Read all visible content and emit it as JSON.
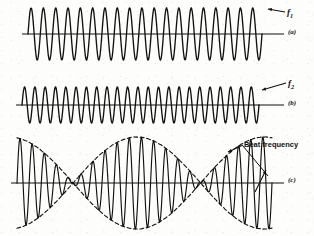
{
  "figure": {
    "background_color": "#fdfdfc",
    "stroke_color": "#111111"
  },
  "labels": {
    "f1": "f",
    "f1_sub": "1",
    "panel_a": "(a)",
    "f2": "f",
    "f2_sub": "2",
    "panel_b": "(b)",
    "beat_frequency": "Beat frequency",
    "panel_c": "(c)"
  },
  "chart_data": {
    "type": "line",
    "xlabel": "",
    "ylabel": "",
    "grid": false,
    "legend": "none",
    "panels": [
      {
        "id": "a",
        "label": "(a)",
        "annotation": "f1",
        "description": "Continuous sine wave of frequency f1, constant amplitude",
        "axis_y": 34,
        "x_start": 28,
        "x_end": 262,
        "cycles": 19,
        "amplitude": 26,
        "envelope": "constant"
      },
      {
        "id": "b",
        "label": "(b)",
        "annotation": "f2",
        "description": "Continuous sine wave of frequency f2, slightly higher than f1, constant amplitude",
        "axis_y": 105,
        "x_start": 22,
        "x_end": 259,
        "cycles": 23,
        "amplitude": 18,
        "envelope": "constant"
      },
      {
        "id": "c",
        "label": "(c)",
        "annotation": "Beat frequency",
        "description": "Sum of f1 and f2 showing amplitude modulation envelope at the beat frequency",
        "axis_y": 183,
        "x_start": 17,
        "x_end": 272,
        "cycles": 21,
        "amplitude": 46,
        "envelope": "beat",
        "envelope_style": "dashed",
        "beat_cycles": 2,
        "node_positions": [
          20,
          150,
          272
        ]
      }
    ]
  }
}
